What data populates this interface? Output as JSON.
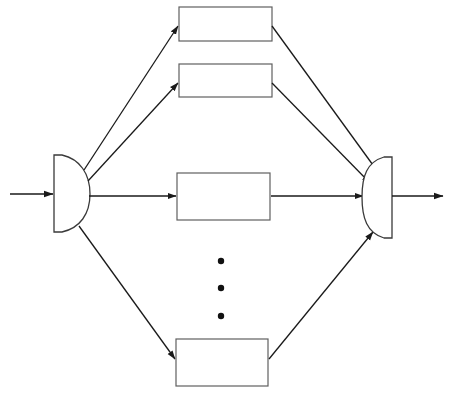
{
  "diagram": {
    "type": "block-diagram",
    "canvas": {
      "width": 451,
      "height": 398,
      "background": "#ffffff"
    },
    "colors": {
      "background": "#ffffff",
      "box_stroke": "#5f5f5f",
      "coupler_stroke": "#3a3a3a",
      "line_stroke": "#1a1a1a",
      "dot_fill": "#111111"
    },
    "input_port": {
      "name": "input",
      "label": "",
      "from_x": 10,
      "to_x": 53,
      "y": 194
    },
    "output_port": {
      "name": "output",
      "label": "",
      "from_x": 392,
      "to_x": 443,
      "y": 196
    },
    "splitter": {
      "name": "splitter",
      "label": "",
      "shape": "half-disc-flat-left",
      "flat_x": 54,
      "apex_x": 90,
      "top_y": 155,
      "bottom_y": 232
    },
    "combiner": {
      "name": "combiner",
      "label": "",
      "shape": "half-disc-flat-right",
      "flat_x": 392,
      "apex_x": 362,
      "top_y": 157,
      "bottom_y": 238
    },
    "branches": [
      {
        "id": "branch-1",
        "label": "",
        "x": 179,
        "y": 7,
        "width": 93,
        "height": 34
      },
      {
        "id": "branch-2",
        "label": "",
        "x": 179,
        "y": 64,
        "width": 93,
        "height": 33
      },
      {
        "id": "branch-3",
        "label": "",
        "x": 177,
        "y": 173,
        "width": 93,
        "height": 47
      },
      {
        "id": "branch-n",
        "label": "",
        "x": 176,
        "y": 339,
        "width": 92,
        "height": 47
      }
    ],
    "ellipsis": {
      "label": "vertical ellipsis indicating additional branches",
      "x": 221,
      "dot_radius": 3.2,
      "dots_y": [
        261,
        288,
        316
      ]
    },
    "connections": [
      {
        "id": "split-to-1",
        "from": "splitter",
        "to": "branch-1",
        "x1": 84,
        "y1": 170,
        "x2": 178,
        "y2": 26
      },
      {
        "id": "split-to-2",
        "from": "splitter",
        "to": "branch-2",
        "x1": 88,
        "y1": 180,
        "x2": 178,
        "y2": 83
      },
      {
        "id": "split-to-3",
        "from": "splitter",
        "to": "branch-3",
        "x1": 89,
        "y1": 196,
        "x2": 176,
        "y2": 196
      },
      {
        "id": "split-to-n",
        "from": "splitter",
        "to": "branch-n",
        "x1": 79,
        "y1": 226,
        "x2": 175,
        "y2": 359
      },
      {
        "id": "b1-to-comb",
        "from": "branch-1",
        "to": "combiner",
        "x1": 272,
        "y1": 26,
        "x2": 378,
        "y2": 172
      },
      {
        "id": "b2-to-comb",
        "from": "branch-2",
        "to": "combiner",
        "x1": 272,
        "y1": 83,
        "x2": 370,
        "y2": 182
      },
      {
        "id": "b3-to-comb",
        "from": "branch-3",
        "to": "combiner",
        "x1": 271,
        "y1": 196,
        "x2": 363,
        "y2": 196
      },
      {
        "id": "bn-to-comb",
        "from": "branch-n",
        "to": "combiner",
        "x1": 269,
        "y1": 359,
        "x2": 373,
        "y2": 232
      }
    ]
  }
}
